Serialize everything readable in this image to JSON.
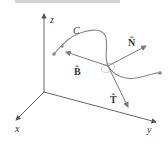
{
  "figure": {
    "type": "3d-frenet-frame",
    "colors": {
      "axes": "#555555",
      "curve": "#8a8a8a",
      "vectors": "#7a7a7a",
      "plane": "#bbbbbb",
      "header": "#d4d4d4"
    }
  },
  "axes": {
    "x_label": "x",
    "y_label": "y",
    "z_label": "z"
  },
  "curve": {
    "label": "C"
  },
  "vectors": {
    "T_label": "T̂",
    "N_label": "N̂",
    "B_label": "B̂"
  }
}
